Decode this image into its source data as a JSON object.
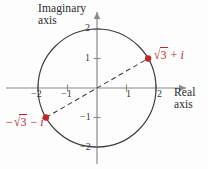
{
  "figure": {
    "background_color": "#fdfdfd"
  },
  "axes": {
    "imaginary": {
      "name_line1": "Imaginary",
      "name_line2": "axis",
      "ticks": [
        "2",
        "1",
        "−1",
        "−2"
      ],
      "tick_values": [
        2,
        1,
        -1,
        -2
      ]
    },
    "real": {
      "name_line1": "Real",
      "name_line2": "axis",
      "ticks": [
        "−2",
        "−1",
        "1",
        "2"
      ],
      "tick_values": [
        -2,
        -1,
        1,
        2
      ]
    },
    "axis_color": "#8a8a8a"
  },
  "circle": {
    "center": [
      0,
      0
    ],
    "radius": 2,
    "stroke_color": "#3c3c3c"
  },
  "segment": {
    "style": "dashed",
    "from": [
      -1.732,
      -1
    ],
    "to": [
      1.732,
      1
    ],
    "color": "#3c3c3c"
  },
  "points": [
    {
      "id": "point-sqrt3-plus-i",
      "coords": [
        1.732,
        1
      ],
      "color": "#c0272d",
      "label": {
        "sign": "",
        "radical": "√",
        "radicand": "3",
        "operator": "+",
        "imaginary_unit": "i",
        "full_text": "√3 + i"
      }
    },
    {
      "id": "point-neg-sqrt3-minus-i",
      "coords": [
        -1.732,
        -1
      ],
      "color": "#c0272d",
      "label": {
        "sign": "−",
        "radical": "√",
        "radicand": "3",
        "operator": "−",
        "imaginary_unit": "i",
        "full_text": "−√3 − i"
      }
    }
  ],
  "colors": {
    "accent_red": "#c0272d",
    "curve": "#3c3c3c",
    "axis": "#8a8a8a",
    "text": "#2b2b2b"
  }
}
